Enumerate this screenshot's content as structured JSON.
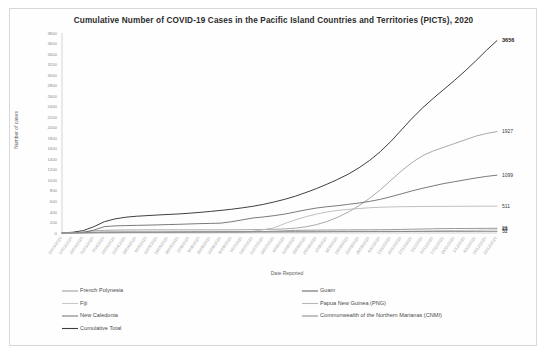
{
  "document": {
    "frame_visible": true,
    "background_color": "#ffffff"
  },
  "chart_data": {
    "type": "line",
    "title": "Cumulative Number of COVID-19 Cases in the Pacific Island Countries and Territories (PICTs), 2020",
    "xlabel": "Date Reported",
    "ylabel": "Number of cases",
    "ylim": [
      0,
      3800
    ],
    "ytick_step": 200,
    "yticks": [
      3800,
      3600,
      3400,
      3200,
      3000,
      2800,
      2600,
      2400,
      2200,
      2000,
      1800,
      1600,
      1400,
      1200,
      1000,
      800,
      600,
      400,
      200,
      0
    ],
    "grid": false,
    "legend_position": "bottom",
    "x": [
      "10/03/2020",
      "17/03/2020",
      "24/03/2020",
      "31/03/2020",
      "7/04/2020",
      "14/04/2020",
      "21/04/2020",
      "28/04/2020",
      "5/05/2020",
      "12/05/2020",
      "19/05/2020",
      "26/05/2020",
      "2/06/2020",
      "9/06/2020",
      "16/06/2020",
      "23/06/2020",
      "30/06/2020",
      "7/07/2020",
      "14/07/2020",
      "21/07/2020",
      "28/07/2020",
      "4/08/2020",
      "11/08/2020",
      "18/08/2020",
      "25/08/2020",
      "1/09/2020",
      "8/09/2020",
      "15/09/2020",
      "22/09/2020",
      "29/09/2020",
      "6/10/2020",
      "13/10/2020",
      "20/10/2020",
      "27/10/2020",
      "3/11/2020",
      "10/11/2020",
      "17/11/2020",
      "24/11/2020",
      "1/12/2020",
      "8/12/2020",
      "15/12/2020",
      "22/12/2020"
    ],
    "xtick_labels": [
      "10/03/2020",
      "17/03/2020",
      "24/03/2020",
      "31/03/2020",
      "7/04/2020",
      "14/04/2020",
      "21/04/2020",
      "28/04/2020",
      "5/05/2020",
      "12/05/2020",
      "19/05/2020",
      "26/05/2020",
      "2/06/2020",
      "9/06/2020",
      "16/06/2020",
      "23/06/2020",
      "30/06/2020",
      "7/07/2020",
      "14/07/2020",
      "21/07/2020",
      "28/07/2020",
      "4/08/2020",
      "11/08/2020",
      "18/08/2020",
      "25/08/2020",
      "1/09/2020",
      "8/09/2020",
      "15/09/2020",
      "22/09/2020",
      "29/09/2020",
      "6/10/2020",
      "13/10/2020",
      "20/10/2020",
      "27/10/2020",
      "3/11/2020",
      "10/11/2020",
      "17/11/2020",
      "24/11/2020",
      "1/12/2020",
      "8/12/2020",
      "15/12/2020",
      "22/12/2020"
    ],
    "series": [
      {
        "name": "Cumulative Total",
        "color": "#3f3f3f",
        "width": 1.0,
        "end_label": "3656",
        "end_label_bold": true,
        "values": [
          2,
          14,
          45,
          120,
          215,
          268,
          300,
          318,
          330,
          342,
          352,
          362,
          376,
          392,
          410,
          430,
          452,
          478,
          508,
          545,
          590,
          640,
          700,
          770,
          845,
          930,
          1020,
          1120,
          1240,
          1380,
          1545,
          1740,
          1960,
          2180,
          2380,
          2560,
          2730,
          2900,
          3080,
          3270,
          3470,
          3656
        ]
      },
      {
        "name": "French Polynesia",
        "color": "#9e9e9e",
        "width": 0.9,
        "end_label": "1927",
        "end_label_bold": false,
        "values": [
          0,
          3,
          18,
          40,
          51,
          55,
          57,
          58,
          59,
          60,
          60,
          60,
          60,
          60,
          60,
          60,
          60,
          62,
          64,
          66,
          70,
          78,
          92,
          118,
          160,
          220,
          300,
          400,
          520,
          660,
          820,
          1000,
          1180,
          1340,
          1470,
          1560,
          1630,
          1700,
          1770,
          1840,
          1890,
          1927
        ]
      },
      {
        "name": "Guam",
        "color": "#6b6b6b",
        "width": 0.9,
        "end_label": "1099",
        "end_label_bold": false,
        "values": [
          0,
          3,
          12,
          55,
          121,
          135,
          141,
          145,
          149,
          154,
          160,
          165,
          172,
          178,
          182,
          188,
          215,
          250,
          285,
          305,
          330,
          360,
          400,
          440,
          475,
          500,
          520,
          545,
          570,
          600,
          640,
          690,
          745,
          800,
          850,
          895,
          940,
          975,
          1010,
          1045,
          1075,
          1099
        ]
      },
      {
        "name": "Papua New Guinea (PNG)",
        "color": "#b8b8b8",
        "width": 0.9,
        "end_label": "511",
        "end_label_bold": false,
        "values": [
          0,
          0,
          1,
          1,
          2,
          2,
          7,
          8,
          8,
          8,
          8,
          8,
          8,
          8,
          8,
          9,
          11,
          11,
          31,
          63,
          100,
          180,
          250,
          310,
          360,
          400,
          430,
          450,
          465,
          480,
          490,
          495,
          500,
          502,
          504,
          505,
          506,
          507,
          508,
          509,
          510,
          511
        ]
      },
      {
        "name": "Fiji",
        "color": "#c9c9c9",
        "width": 0.9,
        "end_label": "63",
        "end_label_bold": false,
        "values": [
          0,
          1,
          5,
          7,
          15,
          16,
          17,
          18,
          18,
          18,
          18,
          18,
          18,
          18,
          18,
          18,
          18,
          18,
          18,
          19,
          22,
          26,
          27,
          27,
          28,
          28,
          29,
          31,
          32,
          32,
          33,
          34,
          35,
          36,
          38,
          44,
          46,
          48,
          50,
          53,
          58,
          63
        ]
      },
      {
        "name": "New Caledonia",
        "color": "#7d7d7d",
        "width": 0.9,
        "end_label": "32",
        "end_label_bold": false,
        "values": [
          0,
          2,
          6,
          14,
          18,
          18,
          18,
          18,
          18,
          18,
          18,
          18,
          19,
          20,
          21,
          21,
          21,
          21,
          22,
          22,
          22,
          22,
          22,
          22,
          23,
          24,
          25,
          26,
          26,
          27,
          27,
          27,
          28,
          29,
          30,
          30,
          31,
          31,
          31,
          32,
          32,
          32
        ]
      },
      {
        "name": "Commonwealth of the Northern Marianas (CNMI)",
        "color": "#8f8f8f",
        "width": 0.9,
        "end_label": "26",
        "end_label_bold": false,
        "values": [
          0,
          0,
          2,
          6,
          11,
          13,
          14,
          14,
          14,
          15,
          18,
          20,
          21,
          22,
          22,
          23,
          24,
          25,
          26,
          29,
          34,
          42,
          49,
          53,
          55,
          57,
          58,
          59,
          60,
          61,
          62,
          64,
          68,
          72,
          76,
          80,
          83,
          85,
          86,
          87,
          88,
          90
        ]
      }
    ]
  },
  "legend": {
    "column_left": [
      {
        "label": "French Polynesia",
        "color": "#9e9e9e"
      },
      {
        "label": "Fiji",
        "color": "#c9c9c9"
      },
      {
        "label": "New Caledonia",
        "color": "#7d7d7d"
      },
      {
        "label": "Cumulative Total",
        "color": "#3f3f3f"
      }
    ],
    "column_right": [
      {
        "label": "Guam",
        "color": "#6b6b6b"
      },
      {
        "label": "Papua New Guinea (PNG)",
        "color": "#b8b8b8"
      },
      {
        "label": "Commonwealth of the Northern Marianas (CNMI)",
        "color": "#8f8f8f"
      }
    ]
  }
}
